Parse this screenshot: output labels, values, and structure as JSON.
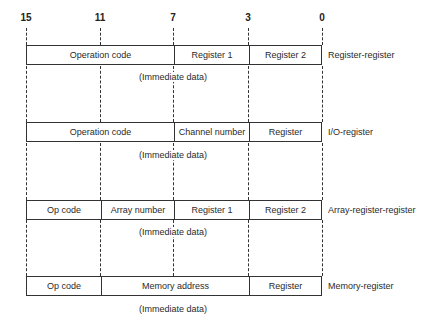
{
  "diagram": {
    "bit_positions": [
      "15",
      "11",
      "7",
      "3",
      "0"
    ],
    "immediate_label": "(Immediate data)",
    "formats": [
      {
        "name": "Register-register",
        "fields": [
          {
            "label": "Operation code",
            "bits": "15-8"
          },
          {
            "label": "Register 1",
            "bits": "7-4"
          },
          {
            "label": "Register 2",
            "bits": "3-0"
          }
        ],
        "immediate": "(Immediate data)"
      },
      {
        "name": "I/O-register",
        "fields": [
          {
            "label": "Operation code",
            "bits": "15-8"
          },
          {
            "label": "Channel number",
            "bits": "7-4"
          },
          {
            "label": "Register",
            "bits": "3-0"
          }
        ],
        "immediate": "(Immediate data)"
      },
      {
        "name": "Array-register-register",
        "fields": [
          {
            "label": "Op code",
            "bits": "15-12"
          },
          {
            "label": "Array number",
            "bits": "11-8"
          },
          {
            "label": "Register 1",
            "bits": "7-4"
          },
          {
            "label": "Register 2",
            "bits": "3-0"
          }
        ],
        "immediate": "(Immediate data)"
      },
      {
        "name": "Memory-register",
        "fields": [
          {
            "label": "Op code",
            "bits": "15-12"
          },
          {
            "label": "Memory address",
            "bits": "11-4"
          },
          {
            "label": "Register",
            "bits": "3-0"
          }
        ],
        "immediate": "(Immediate data)"
      }
    ]
  }
}
